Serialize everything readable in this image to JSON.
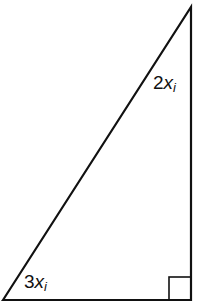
{
  "diagram": {
    "type": "right-triangle",
    "clipped_header_text": "",
    "angles": [
      {
        "name": "top-angle",
        "coef": "2",
        "var": "x",
        "sub": "i"
      },
      {
        "name": "bottom-left-angle",
        "coef": "3",
        "var": "x",
        "sub": "i"
      }
    ],
    "right_angle_marker": "bottom-right",
    "colors": {
      "stroke": "#111111",
      "background": "#ffffff"
    }
  }
}
